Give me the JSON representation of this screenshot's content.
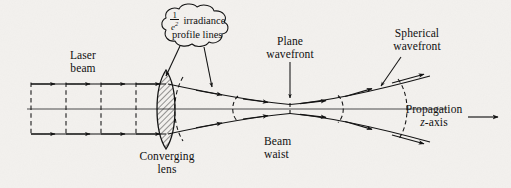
{
  "figure": {
    "background_color": "#f3f1ee",
    "ink_color": "#0d0d0d"
  },
  "labels": {
    "laser_beam": "Laser\nbeam",
    "laser_beam_line1": "Laser",
    "laser_beam_line2": "beam",
    "converging_lens_line1": "Converging",
    "converging_lens_line2": "lens",
    "plane_wavefront_line1": "Plane",
    "plane_wavefront_line2": "wavefront",
    "beam_waist_line1": "Beam",
    "beam_waist_line2": "waist",
    "spherical_wavefront_line1": "Spherical",
    "spherical_wavefront_line2": "wavefront",
    "propagation_line1": "Propagation",
    "propagation_line2": "z-axis",
    "propagation_axis_symbol": "z",
    "propagation_axis_suffix": "-axis"
  },
  "callout": {
    "fraction_numerator": "1",
    "fraction_denominator_base": "e",
    "fraction_denominator_exponent": "2",
    "text_line1": "irradiance",
    "text_line2": "profile lines",
    "shape": "cloud-bubble",
    "arrow_count": 2
  },
  "elements": {
    "optical_axis_name": "optical-axis",
    "lens_name": "converging-lens",
    "lens_fill": "diagonal-hatch",
    "beam_envelope_name": "gaussian-beam-envelope",
    "incoming_wavefronts": 4,
    "outgoing_wavefronts": 5,
    "ray_arrow_count": 18
  }
}
